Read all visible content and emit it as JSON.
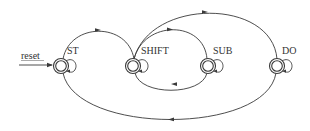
{
  "diagram": {
    "type": "finite-state-machine",
    "reset_label": "reset",
    "line_color": "#3a3a3a",
    "states": [
      {
        "id": "ST",
        "label": "ST",
        "cx": 61,
        "cy": 66,
        "r": 7,
        "self_loop": true,
        "initial": true
      },
      {
        "id": "SHIFT",
        "label": "SHIFT",
        "cx": 133,
        "cy": 66,
        "r": 7,
        "self_loop": true
      },
      {
        "id": "SUB",
        "label": "SUB",
        "cx": 208,
        "cy": 66,
        "r": 7,
        "self_loop": true
      },
      {
        "id": "DO",
        "label": "DO",
        "cx": 277,
        "cy": 66,
        "r": 7,
        "self_loop": true
      }
    ],
    "transitions": [
      {
        "from": "reset",
        "to": "ST"
      },
      {
        "from": "ST",
        "to": "SHIFT",
        "route": "top"
      },
      {
        "from": "SHIFT",
        "to": "SUB",
        "route": "top-inner"
      },
      {
        "from": "SUB",
        "to": "SHIFT",
        "route": "bottom-inner"
      },
      {
        "from": "SHIFT",
        "to": "DO",
        "route": "top-outer"
      },
      {
        "from": "DO",
        "to": "ST",
        "route": "bottom-outer"
      },
      {
        "from": "ST",
        "to": "ST",
        "route": "self"
      },
      {
        "from": "SHIFT",
        "to": "SHIFT",
        "route": "self"
      },
      {
        "from": "SUB",
        "to": "SUB",
        "route": "self"
      },
      {
        "from": "DO",
        "to": "DO",
        "route": "self"
      }
    ]
  }
}
